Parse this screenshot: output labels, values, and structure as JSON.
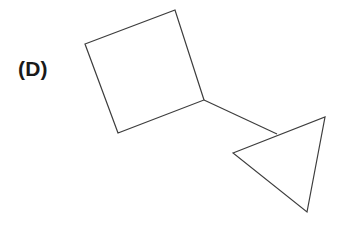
{
  "canvas": {
    "width": 343,
    "height": 226,
    "background_color": "#ffffff"
  },
  "label": {
    "text": "(D)",
    "color": "#1a1a1a",
    "x": 18,
    "y": 56
  },
  "style": {
    "stroke_color": "#3d3d3d",
    "stroke_width": 1.2,
    "fill": "none"
  },
  "figure": {
    "name": "square-connected-to-triangle",
    "shapes": [
      {
        "name": "square",
        "type": "polygon",
        "vertex_count": 4,
        "points": "85,44 175,10 204,100 118,133",
        "vertices": [
          {
            "x": 85,
            "y": 44
          },
          {
            "x": 175,
            "y": 10
          },
          {
            "x": 204,
            "y": 100
          },
          {
            "x": 118,
            "y": 133
          }
        ]
      },
      {
        "name": "triangle",
        "type": "polygon",
        "vertex_count": 3,
        "points": "233,153 325,117 307,212",
        "vertices": [
          {
            "x": 233,
            "y": 153
          },
          {
            "x": 325,
            "y": 117
          },
          {
            "x": 307,
            "y": 212
          }
        ]
      }
    ],
    "connector": {
      "name": "connector-line",
      "type": "line",
      "from": {
        "x": 204,
        "y": 100
      },
      "to": {
        "x": 277,
        "y": 134
      },
      "description": "line from square corner to triangle upper edge"
    }
  }
}
